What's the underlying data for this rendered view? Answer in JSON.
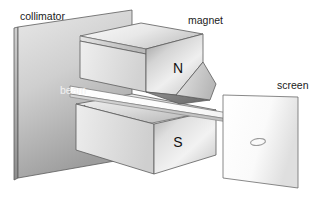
{
  "figure": {
    "background_color": "#ffffff"
  },
  "labels": {
    "collimator": "collimator",
    "magnet": "magnet",
    "beam": "beam",
    "screen": "screen",
    "north_pole": "N",
    "south_pole": "S"
  },
  "colors": {
    "outline": "#5c5c5c",
    "outline_soft": "#8a8a8a",
    "label_text": "#1a1a1a",
    "beam_label_text": "#f2f2f2",
    "collimator_light": "#e2e2e2",
    "collimator_dark": "#9a9a9a",
    "magnet_light": "#fbfbfb",
    "magnet_mid": "#d6d6d6",
    "magnet_dark": "#8f8f8f",
    "screen_light": "#ffffff",
    "screen_dark": "#d8d8d8",
    "beam_fill": "#fdfdfd"
  },
  "parts": {
    "collimator": {
      "name": "collimator",
      "description": "flat rectangular plate with slit on the left"
    },
    "upper_magnet": {
      "name": "magnet",
      "pole": "N",
      "description": "upper wedge-shaped pole piece tapering downward"
    },
    "lower_magnet": {
      "name": "magnet",
      "pole": "S",
      "description": "lower block pole piece with concave grooved top face"
    },
    "beam": {
      "name": "beam",
      "description": "thin particle beam passing between the pole pieces"
    },
    "screen": {
      "name": "screen",
      "description": "detection plate at right showing a single elliptical spot"
    },
    "spot": {
      "name": "beam-spot",
      "description": "elliptical deposit mark on the screen"
    }
  }
}
